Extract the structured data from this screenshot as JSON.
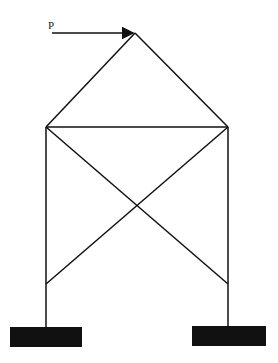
{
  "diagram": {
    "type": "truss frame with diagonal cross bracing",
    "load": {
      "label": "P",
      "direction": "horizontal, pointing right",
      "applied_at": "apex"
    },
    "nodes": {
      "apex": [
        135,
        33
      ],
      "left_top": [
        46,
        127
      ],
      "right_top": [
        228,
        127
      ],
      "left_brace_bottom": [
        46,
        284
      ],
      "right_brace_bottom": [
        228,
        284
      ],
      "left_base": [
        46,
        327
      ],
      "right_base": [
        228,
        326
      ]
    },
    "supports": [
      {
        "name": "left-fixed-support",
        "x": 10,
        "y": 327,
        "w": 72,
        "h": 20
      },
      {
        "name": "right-fixed-support",
        "x": 192,
        "y": 326,
        "w": 74,
        "h": 20
      }
    ],
    "colors": {
      "line": "#111111",
      "support": "#111111",
      "background": "#ffffff"
    }
  }
}
